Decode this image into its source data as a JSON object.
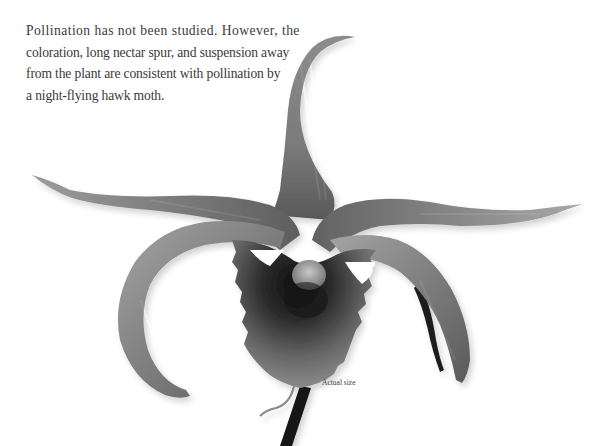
{
  "caption": {
    "lines": [
      "Pollination has not been studied. However, the",
      "coloration, long nectar spur, and suspension away",
      "from the plant are consistent with pollination by",
      "a night-flying hawk moth."
    ]
  },
  "figure": {
    "color_mode": "grayscale",
    "scale_label": "Actual size"
  },
  "colors": {
    "background": "#ffffff",
    "text": "#3a3a3a",
    "petal_light": "#9a9a9a",
    "petal_mid": "#707070",
    "petal_dark": "#2a2a2a",
    "stem": "#1a1a1a"
  }
}
